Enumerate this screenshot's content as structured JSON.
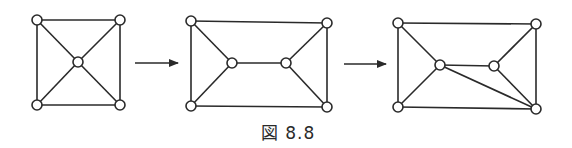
{
  "caption": "図 8.8",
  "graphs": [
    {
      "id": "graph-1",
      "nodes": [
        [
          37,
          20
        ],
        [
          120,
          20
        ],
        [
          78,
          62
        ],
        [
          37,
          105
        ],
        [
          120,
          105
        ]
      ],
      "edges": [
        [
          0,
          1
        ],
        [
          1,
          4
        ],
        [
          4,
          3
        ],
        [
          3,
          0
        ],
        [
          0,
          2
        ],
        [
          1,
          2
        ],
        [
          3,
          2
        ],
        [
          4,
          2
        ]
      ]
    },
    {
      "id": "graph-2",
      "nodes": [
        [
          191,
          21
        ],
        [
          327,
          23
        ],
        [
          232,
          63
        ],
        [
          286,
          63
        ],
        [
          191,
          106
        ],
        [
          327,
          107
        ]
      ],
      "edges": [
        [
          0,
          1
        ],
        [
          1,
          5
        ],
        [
          5,
          4
        ],
        [
          4,
          0
        ],
        [
          0,
          2
        ],
        [
          4,
          2
        ],
        [
          2,
          3
        ],
        [
          1,
          3
        ],
        [
          5,
          3
        ]
      ]
    },
    {
      "id": "graph-3",
      "nodes": [
        [
          398,
          23
        ],
        [
          536,
          24
        ],
        [
          440,
          65
        ],
        [
          494,
          66
        ],
        [
          398,
          107
        ],
        [
          536,
          109
        ]
      ],
      "edges": [
        [
          0,
          1
        ],
        [
          1,
          5
        ],
        [
          5,
          4
        ],
        [
          4,
          0
        ],
        [
          0,
          2
        ],
        [
          4,
          2
        ],
        [
          2,
          3
        ],
        [
          1,
          3
        ],
        [
          5,
          3
        ],
        [
          2,
          5
        ]
      ]
    }
  ],
  "arrows": [
    {
      "x1": 135,
      "y1": 63,
      "x2": 178,
      "y2": 63
    },
    {
      "x1": 344,
      "y1": 64,
      "x2": 386,
      "y2": 64
    }
  ],
  "node_radius": 5,
  "colors": {
    "stroke": "#2a2a2a",
    "background": "#ffffff"
  }
}
